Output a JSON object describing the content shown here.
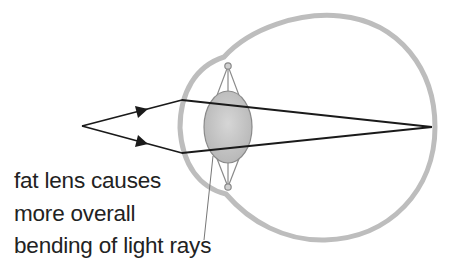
{
  "diagram": {
    "caption_lines": [
      "fat lens causes",
      "more overall",
      "bending of light rays"
    ],
    "elements": {
      "eyeball": "eyeball-outline",
      "cornea": "cornea-bulge",
      "lens": "fat-lens",
      "suspensory_ligaments": "ligaments",
      "light_rays": [
        "upper-ray",
        "lower-ray"
      ],
      "object_point": "object-point",
      "focal_point": "focal-point-on-retina"
    },
    "colors": {
      "eye_outline": "#bdbdbd",
      "lens_fill": "#c8c8c8",
      "lens_stroke": "#8a8a8a",
      "rays": "#1a1a1a",
      "text": "#222222",
      "pointer": "#777777"
    }
  }
}
